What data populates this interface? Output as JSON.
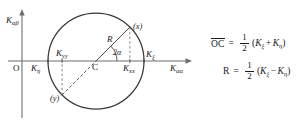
{
  "figure": {
    "kind": "mohr-circle-diagram",
    "background_color": "#ffffff",
    "stroke_color": "#3a3a3a",
    "text_color": "#1a1a1a"
  },
  "axes": {
    "vertical_label": "K",
    "vertical_label_sub": "αβ",
    "horizontal_label": "K",
    "horizontal_label_sub": "αα",
    "origin_label": "O"
  },
  "circle": {
    "center_label": "C",
    "radius_label": "R",
    "angle_label": "2α",
    "center_x": 96,
    "center_y": 61,
    "radius": 48
  },
  "points": {
    "x_point_label": "(x)",
    "y_point_label": "(y)"
  },
  "stress_labels": {
    "k_eta": {
      "base": "K",
      "sub": "η"
    },
    "k_xi": {
      "base": "K",
      "sub": "ξ"
    },
    "k_xx": {
      "base": "K",
      "sub": "xx"
    },
    "k_yy": {
      "base": "K",
      "sub": "yy"
    }
  },
  "equations": [
    {
      "id": "oc-equation",
      "lhs": "OC",
      "lhs_overbar": true,
      "eq": "=",
      "numerator": "1",
      "denominator": "2",
      "rhs_open": "(",
      "rhs_term1_base": "K",
      "rhs_term1_sub": "ξ",
      "rhs_operator": "+",
      "rhs_term2_base": "K",
      "rhs_term2_sub": "η",
      "rhs_close": ")"
    },
    {
      "id": "r-equation",
      "lhs": "R",
      "lhs_overbar": false,
      "eq": "=",
      "numerator": "1",
      "denominator": "2",
      "rhs_open": "(",
      "rhs_term1_base": "K",
      "rhs_term1_sub": "ξ",
      "rhs_operator": "−",
      "rhs_term2_base": "K",
      "rhs_term2_sub": "η",
      "rhs_close": ")"
    }
  ]
}
